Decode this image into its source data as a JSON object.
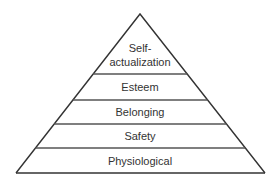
{
  "diagram": {
    "type": "pyramid",
    "tiers": [
      {
        "level": 5,
        "label_lines": [
          "Self-",
          "actualization"
        ]
      },
      {
        "level": 4,
        "label_lines": [
          "Esteem"
        ]
      },
      {
        "level": 3,
        "label_lines": [
          "Belonging"
        ]
      },
      {
        "level": 2,
        "label_lines": [
          "Safety"
        ]
      },
      {
        "level": 1,
        "label_lines": [
          "Physiological"
        ]
      }
    ]
  }
}
